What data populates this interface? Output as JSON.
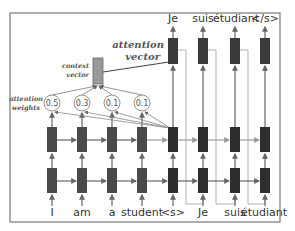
{
  "diagram": {
    "input_tokens": [
      "I",
      "am",
      "a",
      "student",
      "<s>",
      "Je",
      "suis",
      "étudiant"
    ],
    "output_tokens": [
      "Je",
      "suis",
      "étudiant",
      "</s>"
    ],
    "attention_weights": [
      "0.5",
      "0.3",
      "0.1",
      "0.1"
    ],
    "labels": {
      "context_vector_line1": "context",
      "context_vector_line2": "vector",
      "attention_vector_line1": "attention",
      "attention_vector_line2": "vector",
      "attention_weights_line1": "attention",
      "attention_weights_line2": "weights"
    },
    "colors": {
      "encoder_cell": "#4a4a4a",
      "decoder_cell": "#2e2e2e",
      "context_box": "#9a9a9a",
      "arrow": "#666666",
      "feedback_line": "#b0b0b0",
      "frame": "#777777"
    }
  }
}
